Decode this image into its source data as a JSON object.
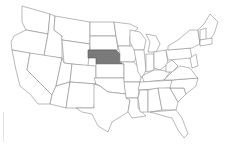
{
  "map": {
    "title": "United States",
    "highlighted_state": "Nebraska",
    "colors": {
      "background": "#ffffff",
      "state_fill": "#ffffff",
      "state_stroke": "#8a8a8a",
      "highlight_fill": "#7a7a7a"
    },
    "states": [
      {
        "id": "WA",
        "name": "Washington",
        "highlighted": false
      },
      {
        "id": "OR",
        "name": "Oregon",
        "highlighted": false
      },
      {
        "id": "CA",
        "name": "California",
        "highlighted": false
      },
      {
        "id": "ID",
        "name": "Idaho",
        "highlighted": false
      },
      {
        "id": "NV",
        "name": "Nevada",
        "highlighted": false
      },
      {
        "id": "MT",
        "name": "Montana",
        "highlighted": false
      },
      {
        "id": "WY",
        "name": "Wyoming",
        "highlighted": false
      },
      {
        "id": "UT",
        "name": "Utah",
        "highlighted": false
      },
      {
        "id": "AZ",
        "name": "Arizona",
        "highlighted": false
      },
      {
        "id": "CO",
        "name": "Colorado",
        "highlighted": false
      },
      {
        "id": "NM",
        "name": "New Mexico",
        "highlighted": false
      },
      {
        "id": "ND",
        "name": "North Dakota",
        "highlighted": false
      },
      {
        "id": "SD",
        "name": "South Dakota",
        "highlighted": false
      },
      {
        "id": "NE",
        "name": "Nebraska",
        "highlighted": true
      },
      {
        "id": "KS",
        "name": "Kansas",
        "highlighted": false
      },
      {
        "id": "OK",
        "name": "Oklahoma",
        "highlighted": false
      },
      {
        "id": "TX",
        "name": "Texas",
        "highlighted": false
      },
      {
        "id": "MN",
        "name": "Minnesota",
        "highlighted": false
      },
      {
        "id": "IA",
        "name": "Iowa",
        "highlighted": false
      },
      {
        "id": "MO",
        "name": "Missouri",
        "highlighted": false
      },
      {
        "id": "AR",
        "name": "Arkansas",
        "highlighted": false
      },
      {
        "id": "LA",
        "name": "Louisiana",
        "highlighted": false
      },
      {
        "id": "WI",
        "name": "Wisconsin",
        "highlighted": false
      },
      {
        "id": "IL",
        "name": "Illinois",
        "highlighted": false
      },
      {
        "id": "MI",
        "name": "Michigan",
        "highlighted": false
      },
      {
        "id": "IN",
        "name": "Indiana",
        "highlighted": false
      },
      {
        "id": "OH",
        "name": "Ohio",
        "highlighted": false
      },
      {
        "id": "KY",
        "name": "Kentucky",
        "highlighted": false
      },
      {
        "id": "TN",
        "name": "Tennessee",
        "highlighted": false
      },
      {
        "id": "MS",
        "name": "Mississippi",
        "highlighted": false
      },
      {
        "id": "AL",
        "name": "Alabama",
        "highlighted": false
      },
      {
        "id": "GA",
        "name": "Georgia",
        "highlighted": false
      },
      {
        "id": "FL",
        "name": "Florida",
        "highlighted": false
      },
      {
        "id": "SC",
        "name": "South Carolina",
        "highlighted": false
      },
      {
        "id": "NC",
        "name": "North Carolina",
        "highlighted": false
      },
      {
        "id": "VA",
        "name": "Virginia",
        "highlighted": false
      },
      {
        "id": "WV",
        "name": "West Virginia",
        "highlighted": false
      },
      {
        "id": "PA",
        "name": "Pennsylvania",
        "highlighted": false
      },
      {
        "id": "NY",
        "name": "New York",
        "highlighted": false
      },
      {
        "id": "NE_REGION",
        "name": "New England",
        "highlighted": false
      }
    ]
  }
}
